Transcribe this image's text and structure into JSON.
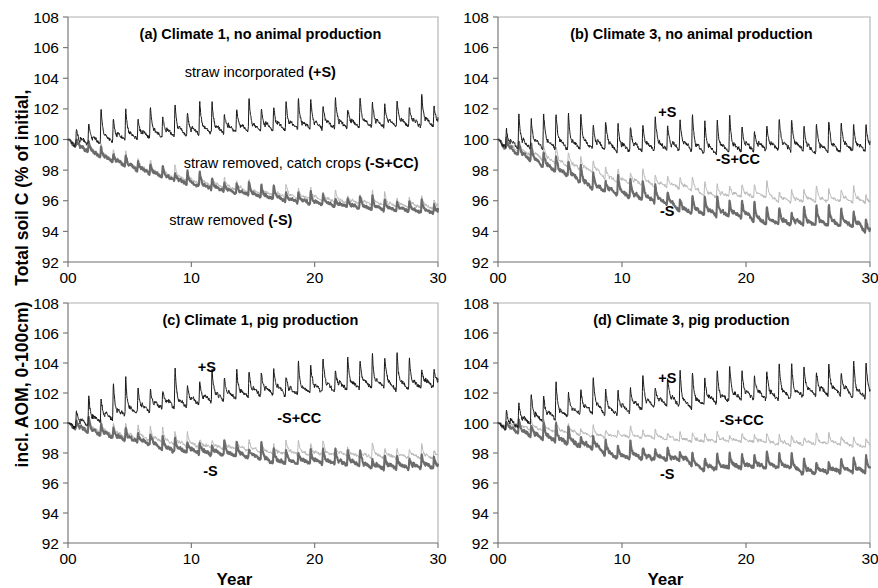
{
  "figure": {
    "ylabel_part1": "Total soil C (% of initial,",
    "ylabel_part2": "incl. AOM, 0-100cm)",
    "xlabel": "Year"
  },
  "chart_data": {
    "type": "line",
    "title": "",
    "xlabel": "Year",
    "ylabel": "Total soil C (% of initial, incl. AOM, 0-100cm)",
    "xlim": [
      0,
      30
    ],
    "ylim": [
      92,
      108
    ],
    "xticks": [
      "00",
      "10",
      "20",
      "30"
    ],
    "xtick_values": [
      0,
      10,
      20,
      30
    ],
    "yticks": [
      "92",
      "94",
      "96",
      "98",
      "100",
      "102",
      "104",
      "106",
      "108"
    ],
    "ytick_values": [
      92,
      94,
      96,
      98,
      100,
      102,
      104,
      106,
      108
    ],
    "grid": false,
    "legend_position": "in-plot annotations",
    "series_styles": [
      {
        "key": "plusS",
        "name": "+S",
        "color": "#1a1a1a",
        "width": 1.0
      },
      {
        "key": "minusScc",
        "name": "-S+CC",
        "color": "#b9b9b9",
        "width": 1.0
      },
      {
        "key": "minusS",
        "name": "-S",
        "color": "#6b6b6b",
        "width": 2.1
      }
    ],
    "panels": [
      {
        "id": "a",
        "title": "(a) Climate 1, no animal production",
        "annotations": [
          {
            "text": "straw incorporated (+S)",
            "series": "plusS",
            "x_frac": 0.52,
            "y_value": 104.1,
            "bold_tail": "(+S)"
          },
          {
            "text": "straw removed, catch crops (-S+CC)",
            "series": "minusScc",
            "x_frac": 0.63,
            "y_value": 98.15,
            "bold_tail": "(-S+CC)"
          },
          {
            "text": "straw removed (-S)",
            "series": "minusS",
            "x_frac": 0.44,
            "y_value": 94.4,
            "bold_tail": "(-S)"
          }
        ],
        "series": {
          "plusS": {
            "start": 100.0,
            "end_mean": 101.4,
            "trend": 1.4,
            "amp": 1.0,
            "spike": 1.25,
            "noise": 0.16,
            "drop": 0.0,
            "seed": 11
          },
          "minusScc": {
            "start": 100.0,
            "end_mean": 95.7,
            "trend": -4.3,
            "amp": 0.42,
            "spike": 0.5,
            "noise": 0.13,
            "drop": 0.0,
            "seed": 23
          },
          "minusS": {
            "start": 100.0,
            "end_mean": 95.4,
            "trend": -4.6,
            "amp": 0.42,
            "spike": 0.5,
            "noise": 0.12,
            "drop": 0.0,
            "seed": 37
          }
        }
      },
      {
        "id": "b",
        "title": "(b) Climate 3, no animal production",
        "annotations": [
          {
            "text": "+S",
            "series": "plusS",
            "x_frac": 0.455,
            "y_value": 101.5,
            "bold_tail": "+S"
          },
          {
            "text": "-S+CC",
            "series": "minusScc",
            "x_frac": 0.645,
            "y_value": 98.4,
            "bold_tail": "-S+CC"
          },
          {
            "text": "-S",
            "series": "minusS",
            "x_frac": 0.455,
            "y_value": 95.0,
            "bold_tail": "-S"
          }
        ],
        "series": {
          "plusS": {
            "start": 100.0,
            "end_mean": 99.9,
            "trend": -0.1,
            "amp": 1.05,
            "spike": 1.3,
            "noise": 0.17,
            "drop": 0.45,
            "seed": 53
          },
          "minusScc": {
            "start": 100.0,
            "end_mean": 96.2,
            "trend": -3.8,
            "amp": 0.55,
            "spike": 0.6,
            "noise": 0.14,
            "drop": 0.4,
            "seed": 67
          },
          "minusS": {
            "start": 100.0,
            "end_mean": 94.6,
            "trend": -5.4,
            "amp": 0.62,
            "spike": 0.7,
            "noise": 0.14,
            "drop": 0.55,
            "seed": 83
          }
        }
      },
      {
        "id": "c",
        "title": "(c) Climate 1, pig production",
        "annotations": [
          {
            "text": "+S",
            "series": "plusS",
            "x_frac": 0.375,
            "y_value": 103.4,
            "bold_tail": "+S"
          },
          {
            "text": "-S+CC",
            "series": "minusScc",
            "x_frac": 0.625,
            "y_value": 100.0,
            "bold_tail": "-S+CC"
          },
          {
            "text": "-S",
            "series": "minusS",
            "x_frac": 0.385,
            "y_value": 96.5,
            "bold_tail": "-S"
          }
        ],
        "series": {
          "plusS": {
            "start": 100.0,
            "end_mean": 103.1,
            "trend": 3.1,
            "amp": 1.05,
            "spike": 1.35,
            "noise": 0.18,
            "drop": 0.3,
            "seed": 97
          },
          "minusScc": {
            "start": 100.0,
            "end_mean": 97.9,
            "trend": -2.1,
            "amp": 0.45,
            "spike": 0.55,
            "noise": 0.14,
            "drop": 0.2,
            "seed": 109
          },
          "minusS": {
            "start": 100.0,
            "end_mean": 97.3,
            "trend": -2.7,
            "amp": 0.5,
            "spike": 0.6,
            "noise": 0.14,
            "drop": 0.3,
            "seed": 127
          }
        }
      },
      {
        "id": "d",
        "title": "(d) Climate 3, pig production",
        "annotations": [
          {
            "text": "+S",
            "series": "plusS",
            "x_frac": 0.455,
            "y_value": 102.7,
            "bold_tail": "+S"
          },
          {
            "text": "-S+CC",
            "series": "minusScc",
            "x_frac": 0.655,
            "y_value": 99.9,
            "bold_tail": "-S+CC"
          },
          {
            "text": "-S",
            "series": "minusS",
            "x_frac": 0.455,
            "y_value": 96.3,
            "bold_tail": "-S"
          }
        ],
        "series": {
          "plusS": {
            "start": 100.0,
            "end_mean": 102.6,
            "trend": 2.6,
            "amp": 1.1,
            "spike": 1.4,
            "noise": 0.18,
            "drop": 0.45,
            "seed": 139
          },
          "minusScc": {
            "start": 100.0,
            "end_mean": 98.8,
            "trend": -1.2,
            "amp": 0.35,
            "spike": 0.42,
            "noise": 0.13,
            "drop": 0.35,
            "seed": 151
          },
          "minusS": {
            "start": 100.0,
            "end_mean": 97.1,
            "trend": -2.9,
            "amp": 0.55,
            "spike": 0.65,
            "noise": 0.15,
            "drop": 0.55,
            "seed": 163
          }
        }
      }
    ]
  }
}
